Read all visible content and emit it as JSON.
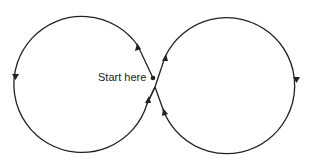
{
  "diagram": {
    "type": "figure-eight path",
    "start_label": "Start here",
    "stroke_color": "#222222",
    "loops": [
      {
        "name": "left-loop",
        "direction": "counterclockwise"
      },
      {
        "name": "right-loop",
        "direction": "clockwise"
      }
    ]
  }
}
